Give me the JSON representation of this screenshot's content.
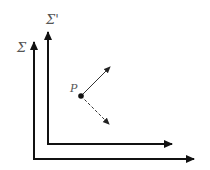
{
  "diagram": {
    "frames": [
      {
        "name": "Σ",
        "label": "Σ",
        "origin": [
          34,
          159
        ],
        "x_end": 196,
        "y_end": 40
      },
      {
        "name": "Σ'",
        "label": "Σ'",
        "origin": [
          48,
          144
        ],
        "x_end": 174,
        "y_end": 30
      }
    ],
    "point": {
      "label": "P",
      "position": [
        81,
        96
      ]
    },
    "vectors": [
      {
        "style": "solid",
        "from": [
          81,
          96
        ],
        "to": [
          111,
          66
        ]
      },
      {
        "style": "dashed",
        "from": [
          81,
          96
        ],
        "to": [
          110,
          125
        ]
      }
    ],
    "colors": {
      "axis": "#111111",
      "vector": "#333333",
      "label": "#555555"
    }
  }
}
